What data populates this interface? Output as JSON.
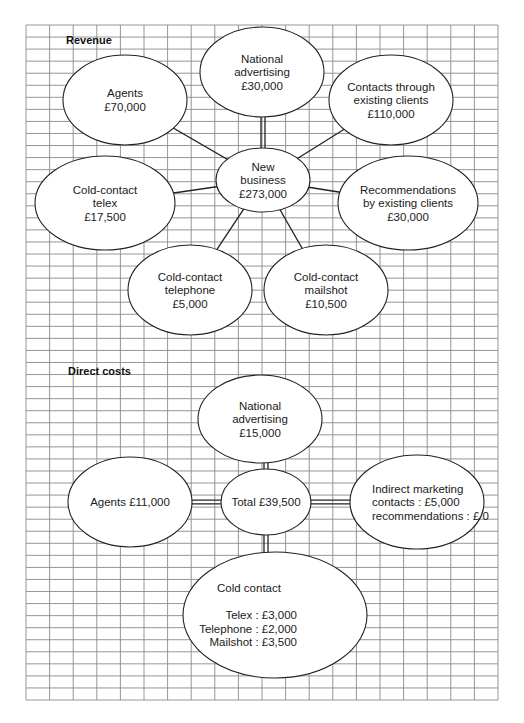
{
  "colors": {
    "grid": "#8a8a8a",
    "outline": "#222222",
    "fill": "#ffffff",
    "text": "#1a1a1a"
  },
  "revenue": {
    "title": "Revenue",
    "center": {
      "id": "new-business",
      "lines": [
        "New",
        "business",
        "£273,000"
      ]
    },
    "nodes": [
      {
        "id": "agents",
        "lines": [
          "Agents",
          "£70,000"
        ]
      },
      {
        "id": "national-advertising",
        "lines": [
          "National",
          "advertising",
          "£30,000"
        ]
      },
      {
        "id": "contacts-existing-clients",
        "lines": [
          "Contacts through",
          "existing clients",
          "£110,000"
        ]
      },
      {
        "id": "cold-contact-telex",
        "lines": [
          "Cold-contact",
          "telex",
          "£17,500"
        ]
      },
      {
        "id": "recommendations-existing-clients",
        "lines": [
          "Recommendations",
          "by existing clients",
          "£30,000"
        ]
      },
      {
        "id": "cold-contact-telephone",
        "lines": [
          "Cold-contact",
          "telephone",
          "£5,000"
        ]
      },
      {
        "id": "cold-contact-mailshot",
        "lines": [
          "Cold-contact",
          "mailshot",
          "£10,500"
        ]
      }
    ]
  },
  "direct_costs": {
    "title": "Direct costs",
    "center": {
      "id": "total",
      "lines": [
        "Total £39,500"
      ]
    },
    "nodes": [
      {
        "id": "national-advertising-cost",
        "lines": [
          "National",
          "advertising",
          "£15,000"
        ]
      },
      {
        "id": "agents-cost",
        "lines": [
          "Agents  £11,000"
        ]
      },
      {
        "id": "indirect-marketing",
        "lines": [
          "Indirect marketing",
          "contacts : £5,000",
          "recommendations : £ 0"
        ]
      },
      {
        "id": "cold-contact",
        "lines": [
          "Cold contact",
          "",
          "Telex : £3,000",
          "Telephone : £2,000",
          "Mailshot : £3,500"
        ]
      }
    ]
  }
}
